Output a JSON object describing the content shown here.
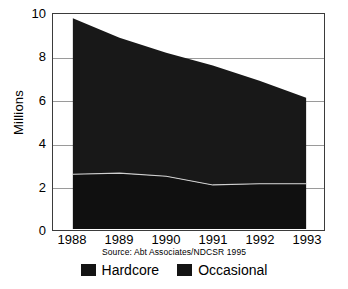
{
  "chart_data": {
    "type": "area",
    "stacked": true,
    "title": "",
    "xlabel": "",
    "ylabel": "Millions",
    "categories": [
      "1988",
      "1989",
      "1990",
      "1991",
      "1992",
      "1993"
    ],
    "x": [
      1988,
      1989,
      1990,
      1991,
      1992,
      1993
    ],
    "xlim": [
      1988,
      1993
    ],
    "ylim": [
      0,
      10
    ],
    "yticks": [
      0,
      2,
      4,
      6,
      8,
      10
    ],
    "ytick_labels": [
      "0",
      "2",
      "4",
      "6",
      "8",
      "10"
    ],
    "xtick_labels": [
      "1988",
      "1989",
      "1990",
      "1991",
      "1992",
      "1993"
    ],
    "grid": true,
    "grid_axis": "y",
    "legend_position": "bottom",
    "series": [
      {
        "name": "Hardcore",
        "color": "#101010",
        "values": [
          2.55,
          2.6,
          2.45,
          2.05,
          2.1,
          2.1
        ]
      },
      {
        "name": "Occasional",
        "color": "#181818",
        "values": [
          7.25,
          6.3,
          5.75,
          5.55,
          4.8,
          4.0
        ]
      }
    ],
    "totals": [
      9.8,
      8.9,
      8.2,
      7.6,
      6.9,
      6.1
    ],
    "annotations": [
      "Source: Abt Associates/NDCSR 1995"
    ]
  },
  "axes": {
    "y_title": "Millions"
  },
  "source_note": "Source: Abt Associates/NDCSR 1995",
  "legend": {
    "items": [
      {
        "label": "Hardcore",
        "color": "#141414"
      },
      {
        "label": "Occasional",
        "color": "#141414"
      }
    ]
  },
  "colors": {
    "area_fill": "#141414",
    "divider_line": "#c8c8c8",
    "frame": "#3b3b3b",
    "grid": "#9a9a9a",
    "background": "#ffffff"
  },
  "footer_mark": ""
}
